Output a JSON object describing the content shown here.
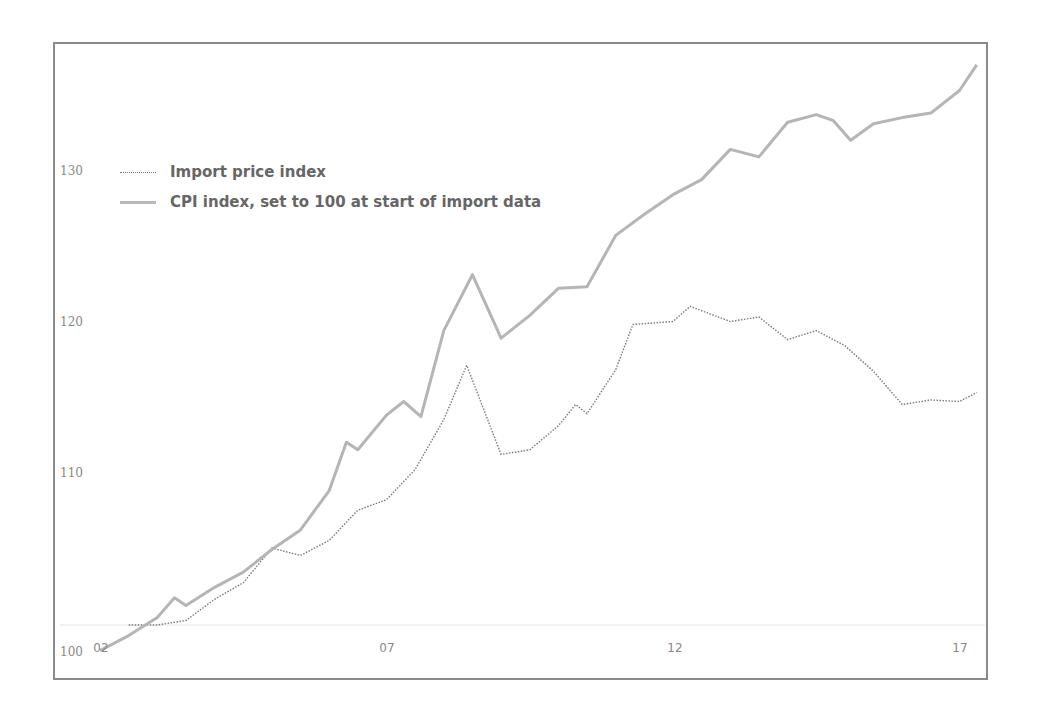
{
  "chart_data": {
    "type": "line",
    "title": "",
    "xlabel": "",
    "ylabel": "",
    "x_ticks": [
      "02",
      "07",
      "12",
      "17"
    ],
    "y_ticks": [
      "100",
      "110",
      "120",
      "130"
    ],
    "ylim": [
      98,
      138
    ],
    "xlim": [
      2002,
      2017.4
    ],
    "grid": false,
    "legend_position": "upper-left",
    "legend": [
      "Import price index",
      "CPI index, set to 100 at start of import data"
    ],
    "series": [
      {
        "name": "Import price index",
        "style": "dotted",
        "color": "#777777",
        "x": [
          2002.5,
          2003.0,
          2003.5,
          2004.0,
          2004.5,
          2005.0,
          2005.5,
          2006.0,
          2006.5,
          2007.0,
          2007.5,
          2008.0,
          2008.4,
          2009.0,
          2009.5,
          2010.0,
          2010.3,
          2010.5,
          2011.0,
          2011.3,
          2012.0,
          2012.3,
          2013.0,
          2013.5,
          2014.0,
          2014.5,
          2015.0,
          2015.5,
          2016.0,
          2016.5,
          2017.0,
          2017.3
        ],
        "values": [
          100.0,
          100.0,
          100.3,
          101.7,
          102.8,
          105.1,
          104.6,
          105.6,
          107.6,
          108.3,
          110.3,
          113.6,
          117.2,
          111.3,
          111.6,
          113.2,
          114.6,
          114.0,
          116.9,
          119.9,
          120.1,
          121.1,
          120.1,
          120.4,
          118.9,
          119.5,
          118.5,
          116.8,
          114.6,
          114.9,
          114.8,
          115.4
        ]
      },
      {
        "name": "CPI index, set to 100 at start of import data",
        "style": "solid",
        "color": "#b8b8b8",
        "x": [
          2002.0,
          2002.5,
          2003.0,
          2003.3,
          2003.5,
          2004.0,
          2004.5,
          2005.0,
          2005.5,
          2006.0,
          2006.3,
          2006.5,
          2007.0,
          2007.3,
          2007.6,
          2008.0,
          2008.5,
          2009.0,
          2009.5,
          2010.0,
          2010.5,
          2011.0,
          2011.5,
          2012.0,
          2012.5,
          2013.0,
          2013.5,
          2014.0,
          2014.5,
          2014.8,
          2015.1,
          2015.5,
          2016.0,
          2016.5,
          2017.0,
          2017.3
        ],
        "values": [
          98.3,
          99.3,
          100.5,
          101.8,
          101.3,
          102.5,
          103.5,
          105.0,
          106.3,
          108.9,
          112.1,
          111.6,
          113.9,
          114.8,
          113.8,
          119.5,
          123.2,
          119.0,
          120.5,
          122.3,
          122.4,
          125.8,
          127.2,
          128.5,
          129.5,
          131.5,
          131.0,
          133.3,
          133.8,
          133.4,
          132.1,
          133.2,
          133.6,
          133.9,
          135.4,
          137.1
        ]
      }
    ]
  },
  "axis": {
    "y_labels": [
      {
        "text": "130",
        "top": 164
      },
      {
        "text": "120",
        "top": 315
      },
      {
        "text": "110",
        "top": 466
      },
      {
        "text": "100",
        "top": 645
      }
    ],
    "x_labels": [
      {
        "text": "02",
        "left": 101
      },
      {
        "text": "07",
        "left": 387
      },
      {
        "text": "12",
        "left": 675
      },
      {
        "text": "17",
        "left": 960
      }
    ]
  },
  "legend": {
    "items": [
      {
        "label": "Import price index",
        "style": "dotted"
      },
      {
        "label": "CPI index, set to 100 at start of import data",
        "style": "solid"
      }
    ]
  }
}
